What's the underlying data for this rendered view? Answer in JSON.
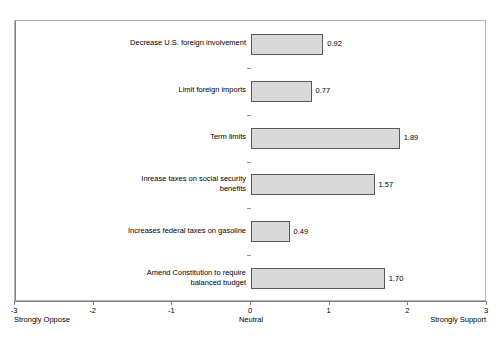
{
  "chart_data": {
    "type": "bar",
    "orientation": "horizontal",
    "title": "",
    "subtitle": "",
    "xlabel": "",
    "ylabel": "",
    "xlim": [
      -3,
      3
    ],
    "xticks": [
      -3,
      -2,
      -1,
      0,
      1,
      2,
      3
    ],
    "xtick_labels": [
      "-3",
      "-2",
      "-1",
      "0",
      "1",
      "2",
      "3"
    ],
    "grid": false,
    "legend": null,
    "axis_anchors": {
      "left": "Strongly Oppose",
      "middle": "Neutral",
      "right": "Strongly Support"
    },
    "categories": [
      "Decrease U.S. foreign involvement",
      "Limit foreign imports",
      "Term limits",
      "Inrease taxes on social security\nbenefits",
      "Increases federal taxes on gasoline",
      "Amend Constitution to require\nbalanced budget"
    ],
    "values": [
      0.92,
      0.77,
      1.89,
      1.57,
      0.49,
      1.7
    ],
    "value_labels": [
      "0.92",
      "0.77",
      "1.89",
      "1.57",
      "0.49",
      "1.70"
    ],
    "colors": {
      "bar_fill": "#d9d9d9",
      "bar_border": "#595959",
      "axis": "#808080",
      "frame": "#b4b4b4",
      "text": "#000000",
      "background": "#ffffff"
    }
  }
}
